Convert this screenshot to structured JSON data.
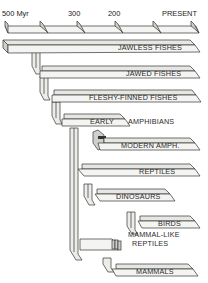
{
  "diagram": {
    "type": "phylogenetic-tree",
    "axis": {
      "ticks": [
        {
          "label": "500 Myr",
          "x": 5
        },
        {
          "label": "300",
          "x": 68
        },
        {
          "label": "200",
          "x": 108
        },
        {
          "label": "",
          "x": 155
        },
        {
          "label": "PRESENT",
          "x": 190
        }
      ]
    },
    "groups": [
      {
        "id": "jawless-fishes",
        "label": "JAWLESS FISHES"
      },
      {
        "id": "jawed-fishes",
        "label": "JAWED FISHES"
      },
      {
        "id": "fleshy-finned-fishes",
        "label": "FLESHY-FINNED FISHES"
      },
      {
        "id": "early-amphibians",
        "label_left": "EARLY",
        "label_right": "AMPHIBIANS"
      },
      {
        "id": "modern-amphibians",
        "label": "MODERN AMPH."
      },
      {
        "id": "reptiles",
        "label": "REPTILES"
      },
      {
        "id": "dinosaurs",
        "label": "DINOSAURS"
      },
      {
        "id": "birds",
        "label": "BIRDS"
      },
      {
        "id": "mammal-like-reptiles",
        "label_line1": "MAMMAL-LIKE",
        "label_line2": "REPTILES"
      },
      {
        "id": "mammals",
        "label": "MAMMALS"
      }
    ]
  }
}
